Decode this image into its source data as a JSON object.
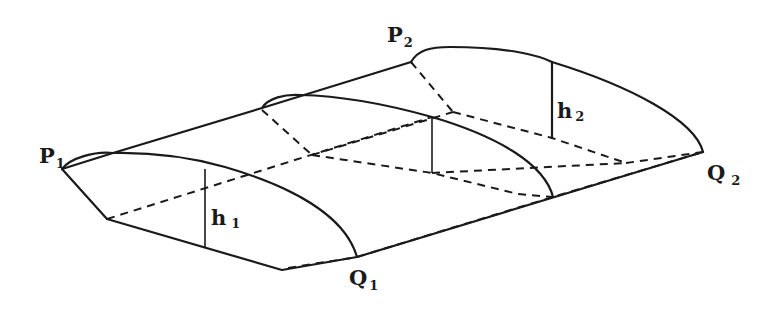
{
  "diagram": {
    "type": "wing-surface-perspective",
    "labels": {
      "p1": {
        "main": "P",
        "sub": "1"
      },
      "p2": {
        "main": "P",
        "sub": "2"
      },
      "q1": {
        "main": "Q",
        "sub": "1"
      },
      "q2": {
        "main": "Q",
        "sub": "2"
      },
      "h1": {
        "main": "h",
        "sub": "1"
      },
      "h2": {
        "main": "h",
        "sub": "2"
      }
    },
    "colors": {
      "stroke": "#1a1a1a",
      "background": "#ffffff"
    }
  }
}
